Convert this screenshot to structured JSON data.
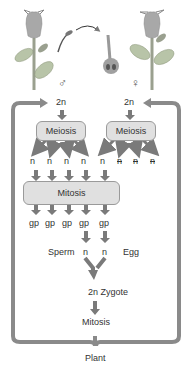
{
  "diagram": {
    "colors": {
      "arrow": "#7a7a7a",
      "box_fill": "#e0e0e0",
      "box_border": "#9a9a9a",
      "leaf": "#b8c4a8",
      "flower": "#a8a8a8",
      "text": "#333333"
    },
    "male": {
      "symbol": "♂",
      "ploidy": "2n",
      "meiosis_label": "Meiosis",
      "products": [
        "n",
        "n",
        "n",
        "n"
      ]
    },
    "female": {
      "symbol": "♀",
      "ploidy": "2n",
      "meiosis_label": "Meiosis",
      "products": [
        "n",
        "n",
        "n",
        "n"
      ],
      "degenerated_note": "three crossed-out n (degenerate)"
    },
    "mitosis_label": "Mitosis",
    "gametophytes": [
      "gp",
      "gp",
      "gp",
      "gp",
      "gp"
    ],
    "sperm_label": "Sperm",
    "sperm_n": "n",
    "egg_n": "n",
    "egg_label": "Egg",
    "zygote_label": "2n Zygote",
    "zygote_mitosis_label": "Mitosis",
    "plant_label": "Plant"
  }
}
